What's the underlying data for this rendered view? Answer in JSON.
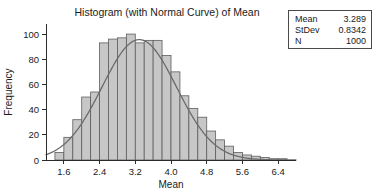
{
  "chart_data": {
    "type": "bar",
    "title": "Histogram (with Normal Curve) of Mean",
    "xlabel": "Mean",
    "ylabel": "Frequency",
    "xlim": [
      1.2,
      6.8
    ],
    "ylim": [
      0,
      108
    ],
    "grid": false,
    "legend": "none",
    "bin_width": 0.2,
    "bin_centers": [
      1.5,
      1.7,
      1.9,
      2.1,
      2.3,
      2.5,
      2.7,
      2.9,
      3.1,
      3.3,
      3.5,
      3.7,
      3.9,
      4.1,
      4.3,
      4.5,
      4.7,
      4.9,
      5.1,
      5.3,
      5.5,
      5.7,
      5.9,
      6.1,
      6.3,
      6.5
    ],
    "values": [
      6,
      18,
      32,
      50,
      54,
      93,
      96,
      97,
      100,
      93,
      95,
      95,
      83,
      70,
      51,
      41,
      34,
      23,
      16,
      11,
      6,
      4,
      3,
      2,
      1,
      1
    ],
    "xticks": [
      "1.6",
      "2.4",
      "3.2",
      "4.0",
      "4.8",
      "5.6",
      "6.4"
    ],
    "xtick_values": [
      1.6,
      2.4,
      3.2,
      4.0,
      4.8,
      5.6,
      6.4
    ],
    "yticks": [
      "0",
      "20",
      "40",
      "60",
      "80",
      "100"
    ],
    "ytick_values": [
      0,
      20,
      40,
      60,
      80,
      100
    ],
    "overlay": {
      "type": "line",
      "name": "normal-curve",
      "mean": 3.289,
      "stdev": 0.8342,
      "n": 1000,
      "scale_peak": 95.6
    },
    "colors": {
      "bar_fill": "#c7c7c7",
      "bar_stroke": "#5e5e5e",
      "curve": "#6b6b6b",
      "axis": "#2b2b2b",
      "text": "#1a1a1a"
    }
  },
  "stats_box": {
    "rows": [
      {
        "key": "Mean",
        "value": "3.289"
      },
      {
        "key": "StDev",
        "value": "0.8342"
      },
      {
        "key": "N",
        "value": "1000"
      }
    ]
  }
}
